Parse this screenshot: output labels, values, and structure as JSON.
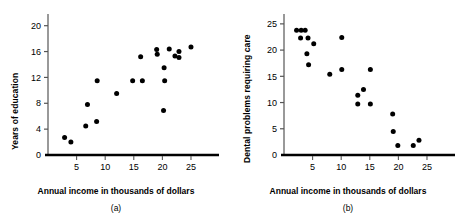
{
  "figure": {
    "panels": [
      {
        "id": "a",
        "caption": "(a)",
        "xlabel": "Annual income in thousands of dollars",
        "ylabel": "Years of education"
      },
      {
        "id": "b",
        "caption": "(b)",
        "xlabel": "Annual income in thousands of dollars",
        "ylabel": "Dental problems requiring care"
      }
    ]
  },
  "chart_data": [
    {
      "type": "scatter",
      "title": "",
      "panel": "(a)",
      "xlabel": "Annual income in thousands of dollars",
      "ylabel": "Years of education",
      "xlim": [
        0,
        28.5
      ],
      "ylim": [
        0,
        21.5
      ],
      "xticks": [
        5,
        10,
        15,
        20,
        25
      ],
      "yticks": [
        0,
        4,
        8,
        12,
        16,
        20
      ],
      "grid": false,
      "legend": "none",
      "marker": "filled-circle",
      "marker_color": "#000000",
      "points": [
        {
          "x": 2.9,
          "y": 2.7
        },
        {
          "x": 4.0,
          "y": 2.0
        },
        {
          "x": 6.6,
          "y": 4.5
        },
        {
          "x": 6.9,
          "y": 7.8
        },
        {
          "x": 8.5,
          "y": 5.2
        },
        {
          "x": 8.6,
          "y": 11.5
        },
        {
          "x": 12.0,
          "y": 9.5
        },
        {
          "x": 14.8,
          "y": 11.5
        },
        {
          "x": 16.2,
          "y": 15.2
        },
        {
          "x": 16.5,
          "y": 11.5
        },
        {
          "x": 19.0,
          "y": 16.3
        },
        {
          "x": 19.1,
          "y": 15.6
        },
        {
          "x": 20.2,
          "y": 6.9
        },
        {
          "x": 20.3,
          "y": 13.5
        },
        {
          "x": 20.4,
          "y": 11.5
        },
        {
          "x": 21.2,
          "y": 16.4
        },
        {
          "x": 22.2,
          "y": 15.3
        },
        {
          "x": 22.9,
          "y": 16.0
        },
        {
          "x": 22.9,
          "y": 15.1
        },
        {
          "x": 25.0,
          "y": 16.7
        }
      ]
    },
    {
      "type": "scatter",
      "title": "",
      "panel": "(b)",
      "xlabel": "Annual income in thousands of dollars",
      "ylabel": "Dental problems requiring care",
      "xlim": [
        0,
        28.5
      ],
      "ylim": [
        0,
        26.5
      ],
      "xticks": [
        5,
        10,
        15,
        20,
        25
      ],
      "yticks": [
        0,
        5,
        10,
        15,
        20,
        25
      ],
      "grid": false,
      "legend": "none",
      "marker": "filled-circle",
      "marker_color": "#000000",
      "points": [
        {
          "x": 2.2,
          "y": 23.8
        },
        {
          "x": 3.0,
          "y": 23.8
        },
        {
          "x": 3.7,
          "y": 23.8
        },
        {
          "x": 2.9,
          "y": 22.3
        },
        {
          "x": 4.2,
          "y": 22.3
        },
        {
          "x": 5.2,
          "y": 21.2
        },
        {
          "x": 4.0,
          "y": 19.3
        },
        {
          "x": 4.3,
          "y": 17.2
        },
        {
          "x": 8.0,
          "y": 15.4
        },
        {
          "x": 10.1,
          "y": 22.4
        },
        {
          "x": 10.1,
          "y": 16.3
        },
        {
          "x": 12.9,
          "y": 11.4
        },
        {
          "x": 12.9,
          "y": 9.7
        },
        {
          "x": 13.9,
          "y": 12.5
        },
        {
          "x": 15.1,
          "y": 16.3
        },
        {
          "x": 15.1,
          "y": 9.7
        },
        {
          "x": 19.0,
          "y": 7.8
        },
        {
          "x": 19.1,
          "y": 4.5
        },
        {
          "x": 19.9,
          "y": 1.8
        },
        {
          "x": 22.6,
          "y": 1.8
        },
        {
          "x": 23.6,
          "y": 2.8
        }
      ]
    }
  ]
}
